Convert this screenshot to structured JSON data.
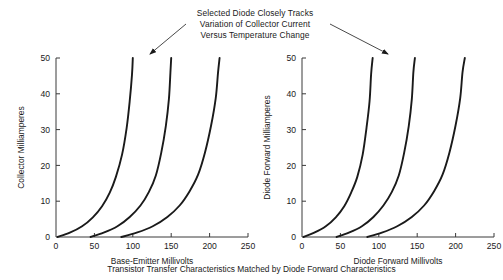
{
  "figure": {
    "background_color": "#ffffff",
    "line_color": "#1a1a1a",
    "caption": "Transistor Transfer Characteristics Matched by Diode Forward Characteristics",
    "annotation_lines": [
      "Selected Diode Closely Tracks",
      "Variation of Collector Current",
      "Versus Temperature Change"
    ]
  },
  "chart_data": [
    {
      "type": "line",
      "title": "",
      "xlabel": "Base-Emitter Millivolts",
      "ylabel": "Collector Milliamperes",
      "xlim": [
        0,
        250
      ],
      "ylim": [
        0,
        50
      ],
      "xticks": [
        0,
        50,
        100,
        150,
        200,
        250
      ],
      "yticks": [
        0,
        10,
        20,
        30,
        40,
        50
      ],
      "xtick_labels": [
        "0",
        "50",
        "100",
        "150",
        "200",
        "250"
      ],
      "ytick_labels": [
        "0",
        "10",
        "20",
        "30",
        "40",
        "50"
      ],
      "grid": false,
      "legend": "none",
      "series": [
        {
          "name": "curve-1",
          "x": [
            2,
            18,
            34,
            48,
            60,
            70,
            78,
            86,
            92,
            96,
            99,
            100
          ],
          "y": [
            0,
            1.2,
            3.0,
            5.5,
            8.6,
            12.4,
            16.8,
            23.0,
            30.5,
            38.0,
            45.5,
            50
          ]
        },
        {
          "name": "curve-2",
          "x": [
            45,
            62,
            80,
            96,
            110,
            121,
            130,
            137,
            143,
            147,
            149,
            150
          ],
          "y": [
            0,
            1.2,
            3.0,
            5.6,
            8.8,
            12.6,
            17.2,
            23.5,
            31.0,
            38.5,
            46.0,
            50
          ]
        },
        {
          "name": "curve-3",
          "x": [
            85,
            105,
            126,
            145,
            161,
            174,
            185,
            194,
            202,
            208,
            211,
            213
          ],
          "y": [
            0,
            1.2,
            3.0,
            5.6,
            8.8,
            12.8,
            17.4,
            23.6,
            31.2,
            38.8,
            46.0,
            50
          ]
        }
      ]
    },
    {
      "type": "line",
      "title": "",
      "xlabel": "Diode Forward Millivolts",
      "ylabel": "Diode Forward Milliamperes",
      "xlim": [
        0,
        250
      ],
      "ylim": [
        0,
        50
      ],
      "xticks": [
        0,
        50,
        100,
        150,
        200,
        250
      ],
      "yticks": [
        0,
        10,
        20,
        30,
        40,
        50
      ],
      "xtick_labels": [
        "0",
        "50",
        "100",
        "150",
        "200",
        "250"
      ],
      "ytick_labels": [
        "0",
        "10",
        "20",
        "30",
        "40",
        "50"
      ],
      "grid": false,
      "legend": "none",
      "series": [
        {
          "name": "curve-1",
          "x": [
            2,
            16,
            31,
            44,
            55,
            64,
            72,
            79,
            84,
            88,
            90,
            92
          ],
          "y": [
            0,
            1.2,
            3.0,
            5.5,
            8.6,
            12.4,
            16.8,
            23.0,
            30.5,
            38.0,
            45.5,
            50
          ]
        },
        {
          "name": "curve-2",
          "x": [
            45,
            61,
            78,
            93,
            106,
            117,
            126,
            133,
            139,
            143,
            145,
            147
          ],
          "y": [
            0,
            1.2,
            3.0,
            5.6,
            8.8,
            12.6,
            17.2,
            23.5,
            31.0,
            38.5,
            46.0,
            50
          ]
        },
        {
          "name": "curve-3",
          "x": [
            85,
            104,
            124,
            143,
            159,
            172,
            183,
            192,
            200,
            206,
            209,
            212
          ],
          "y": [
            0,
            1.2,
            3.0,
            5.6,
            8.8,
            12.8,
            17.4,
            23.6,
            31.2,
            38.8,
            46.0,
            50
          ]
        }
      ]
    }
  ]
}
